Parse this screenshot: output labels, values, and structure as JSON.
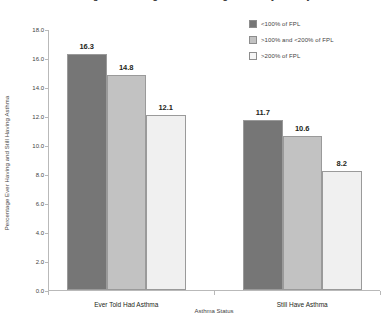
{
  "chart_data": {
    "type": "bar",
    "title": "Percentage Ever Having and Still Having Asthma by Poverty Level",
    "xlabel": "Asthma Status",
    "ylabel": "Percentage Ever Having and Still Having Asthma",
    "ylim": [
      0.0,
      18.0
    ],
    "ytick_labels": [
      "0.0",
      "2.0",
      "4.0",
      "6.0",
      "8.0",
      "10.0",
      "12.0",
      "14.0",
      "16.0",
      "18.0"
    ],
    "ytick_values": [
      0.0,
      2.0,
      4.0,
      6.0,
      8.0,
      10.0,
      12.0,
      14.0,
      16.0,
      18.0
    ],
    "categories": [
      "Ever Told Had Asthma",
      "Still Have Asthma"
    ],
    "grid": false,
    "legend_position": "top-right",
    "series": [
      {
        "name": "<100% of FPL",
        "color": "#767676",
        "values": [
          16.3,
          11.7
        ],
        "labels": [
          "16.3",
          "11.7"
        ]
      },
      {
        "name": ">100% and  <200% of FPL",
        "color": "#c2c2c2",
        "values": [
          14.8,
          10.6
        ],
        "labels": [
          "14.8",
          "10.6"
        ]
      },
      {
        "name": ">200% of  FPL",
        "color": "#f0f0f0",
        "values": [
          12.1,
          8.2
        ],
        "labels": [
          "12.1",
          "8.2"
        ]
      }
    ]
  }
}
